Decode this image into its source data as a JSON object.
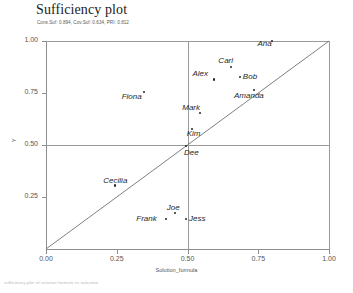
{
  "chart_data": {
    "type": "scatter",
    "title": "Sufficiency plot",
    "subtitle": "Cons.Suf: 0.894, Cov.Suf: 0.634, PRI: 0.812",
    "footnote": "sufficiency plot of solution formula vs outcome",
    "xlabel": "Solution_formula",
    "ylabel": "Y",
    "xlim": [
      0.0,
      1.0
    ],
    "ylim": [
      0.0,
      1.0
    ],
    "xticks": [
      "0.00",
      "0.25",
      "0.50",
      "0.75",
      "1.00"
    ],
    "xtickvals": [
      0.0,
      0.25,
      0.5,
      0.75,
      1.0
    ],
    "yticks": [
      "0.25",
      "0.50",
      "0.75",
      "1.00"
    ],
    "ytickvals": [
      0.25,
      0.5,
      0.75,
      1.0
    ],
    "grid": true,
    "gridlines_x": [
      0.5,
      1.0
    ],
    "gridlines_y": [
      0.5,
      1.0
    ],
    "reference_line": {
      "type": "diagonal",
      "from": [
        0.0,
        0.0
      ],
      "to": [
        1.0,
        1.0
      ]
    },
    "legend": "none",
    "points": [
      {
        "label": "Ana",
        "x": 0.8,
        "y": 1.0,
        "lx": -15,
        "ly": 7
      },
      {
        "label": "Carl",
        "x": 0.655,
        "y": 0.875,
        "lx": -13,
        "ly": -2
      },
      {
        "label": "Bob",
        "x": 0.685,
        "y": 0.825,
        "lx": 3,
        "ly": 4
      },
      {
        "label": "Alex",
        "x": 0.595,
        "y": 0.815,
        "lx": -22,
        "ly": -1
      },
      {
        "label": "Amanda",
        "x": 0.735,
        "y": 0.765,
        "lx": -20,
        "ly": 10
      },
      {
        "label": "Fiona",
        "x": 0.345,
        "y": 0.755,
        "lx": -22,
        "ly": 9
      },
      {
        "label": "Mark",
        "x": 0.545,
        "y": 0.655,
        "lx": -18,
        "ly": -1
      },
      {
        "label": "Kim",
        "x": 0.515,
        "y": 0.575,
        "lx": -5,
        "ly": 9
      },
      {
        "label": "Dee",
        "x": 0.495,
        "y": 0.495,
        "lx": -2,
        "ly": 11
      },
      {
        "label": "Cecilia",
        "x": 0.245,
        "y": 0.305,
        "lx": -12,
        "ly": -1
      },
      {
        "label": "Joe",
        "x": 0.455,
        "y": 0.175,
        "lx": -8,
        "ly": -1
      },
      {
        "label": "Frank",
        "x": 0.425,
        "y": 0.145,
        "lx": -30,
        "ly": 4
      },
      {
        "label": "Jess",
        "x": 0.495,
        "y": 0.145,
        "lx": 3,
        "ly": 4
      }
    ]
  }
}
